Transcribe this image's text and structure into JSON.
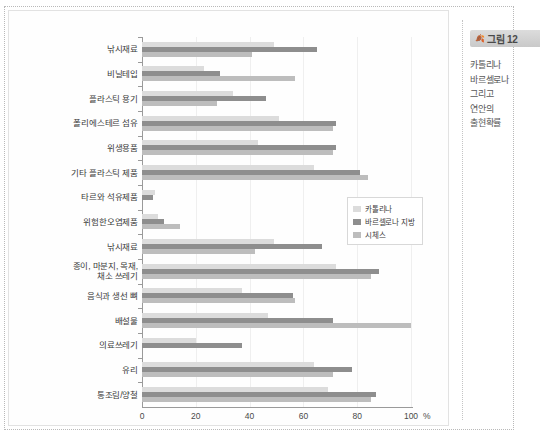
{
  "figure": {
    "tab_label": "그림 12",
    "tab_icon": "leaf-icon",
    "caption_lines": [
      "카톨리나",
      "바르셀로나",
      "그리고",
      "연안의",
      "출현확률"
    ]
  },
  "legend": {
    "position": "middle-right",
    "items": [
      {
        "label": "카톨리나",
        "color": "#dcdcdc"
      },
      {
        "label": "바르셀로나 지방",
        "color": "#8e8e8e"
      },
      {
        "label": "시체스",
        "color": "#bdbdbd"
      }
    ]
  },
  "axis": {
    "x_unit": "%",
    "x_ticks": [
      "0",
      "20",
      "40",
      "60",
      "80",
      "100"
    ]
  },
  "chart_data": {
    "type": "bar",
    "orientation": "horizontal",
    "title": "",
    "subtitle": "",
    "xlabel": "%",
    "ylabel": "",
    "xlim": [
      0,
      100
    ],
    "grid": true,
    "legend_position": "middle-right",
    "categories": [
      "낚시재료",
      "비닐테입",
      "플라스틱 용기",
      "폴리에스테르 섬유",
      "위생용품",
      "기타 플라스틱 제품",
      "타르와 석유제품",
      "위험한오염제품",
      "낚시재료",
      "종이, 마분지, 목재,\n채소 쓰레기",
      "음식과 생선 뼈",
      "배설물",
      "의료쓰레기",
      "유리",
      "통조림/양철"
    ],
    "series": [
      {
        "name": "카톨리나",
        "color": "#dcdcdc",
        "values": [
          49,
          23,
          34,
          51,
          43,
          64,
          5,
          6,
          49,
          72,
          37,
          47,
          20,
          64,
          69
        ]
      },
      {
        "name": "바르셀로나 지방",
        "color": "#8e8e8e",
        "values": [
          65,
          29,
          46,
          72,
          72,
          81,
          4,
          8,
          67,
          88,
          56,
          71,
          37,
          78,
          87
        ]
      },
      {
        "name": "시체스",
        "color": "#bdbdbd",
        "values": [
          41,
          57,
          28,
          71,
          71,
          84,
          0,
          14,
          42,
          85,
          57,
          100,
          0,
          71,
          85
        ]
      }
    ]
  }
}
